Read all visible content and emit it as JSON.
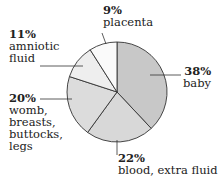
{
  "chart_data": {
    "type": "pie",
    "title": "",
    "categories": [
      "baby",
      "blood, extra fluid",
      "womb, breasts, buttocks, legs",
      "amniotic fluid",
      "placenta"
    ],
    "values": [
      38,
      22,
      20,
      11,
      9
    ],
    "labels": [
      {
        "pct": "38%",
        "text": [
          "baby"
        ]
      },
      {
        "pct": "22%",
        "text": [
          "blood, extra fluid"
        ]
      },
      {
        "pct": "20%",
        "text": [
          "womb,",
          "breasts,",
          "buttocks,",
          "legs"
        ]
      },
      {
        "pct": "11%",
        "text": [
          "amniotic",
          "fluid"
        ]
      },
      {
        "pct": "9%",
        "text": [
          "placenta"
        ]
      }
    ],
    "colors": [
      "#c8c8c8",
      "#d8d8d8",
      "#dcdcdc",
      "#eeeeee",
      "#fafafa"
    ],
    "legend": "none"
  }
}
